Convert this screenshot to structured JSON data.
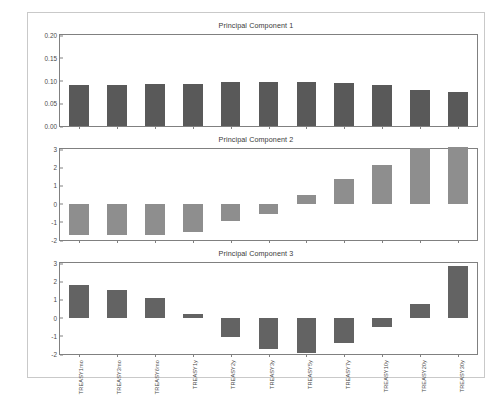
{
  "figure": {
    "border_color": "#c9c9c9",
    "background": "#ffffff"
  },
  "chart_data": [
    {
      "type": "bar",
      "title": "Principal Component 1",
      "xlabel": "",
      "ylabel": "",
      "ylim": [
        0.0,
        0.2
      ],
      "yticks": [
        "0.00",
        "0.05",
        "0.10",
        "0.15",
        "0.20"
      ],
      "ytick_values": [
        0.0,
        0.05,
        0.1,
        0.15,
        0.2
      ],
      "grid": false,
      "bar_color": "#595959",
      "categories": [
        "TREASY1mo",
        "TREASY3mo",
        "TREASY6mo",
        "TREASY1y",
        "TREASY2y",
        "TREASY3y",
        "TREASY5y",
        "TREASY7y",
        "TREASY10y",
        "TREASY20y",
        "TREASY30y"
      ],
      "values": [
        0.09,
        0.09,
        0.092,
        0.093,
        0.096,
        0.097,
        0.097,
        0.094,
        0.09,
        0.08,
        0.075
      ]
    },
    {
      "type": "bar",
      "title": "Principal Component 2",
      "xlabel": "",
      "ylabel": "",
      "ylim": [
        -2,
        3
      ],
      "yticks": [
        "-2",
        "-1",
        "0",
        "1",
        "2",
        "3"
      ],
      "ytick_values": [
        -2,
        -1,
        0,
        1,
        2,
        3
      ],
      "grid": false,
      "bar_color": "#8e8e8e",
      "categories": [
        "TREASY1mo",
        "TREASY3mo",
        "TREASY6mo",
        "TREASY1y",
        "TREASY2y",
        "TREASY3y",
        "TREASY5y",
        "TREASY7y",
        "TREASY10y",
        "TREASY20y",
        "TREASY30y"
      ],
      "values": [
        -1.75,
        -1.75,
        -1.75,
        -1.55,
        -0.95,
        -0.55,
        0.45,
        1.35,
        2.1,
        3.05,
        3.1
      ]
    },
    {
      "type": "bar",
      "title": "Principal Component 3",
      "xlabel": "",
      "ylabel": "",
      "ylim": [
        -2,
        3
      ],
      "yticks": [
        "-2",
        "-1",
        "0",
        "1",
        "2",
        "3"
      ],
      "ytick_values": [
        -2,
        -1,
        0,
        1,
        2,
        3
      ],
      "grid": false,
      "bar_color": "#636363",
      "categories": [
        "TREASY1mo",
        "TREASY3mo",
        "TREASY6mo",
        "TREASY1y",
        "TREASY2y",
        "TREASY3y",
        "TREASY5y",
        "TREASY7y",
        "TREASY10y",
        "TREASY20y",
        "TREASY30y"
      ],
      "values": [
        1.8,
        1.52,
        1.05,
        0.22,
        -1.05,
        -1.75,
        -1.95,
        -1.42,
        -0.52,
        0.75,
        2.85
      ]
    }
  ]
}
